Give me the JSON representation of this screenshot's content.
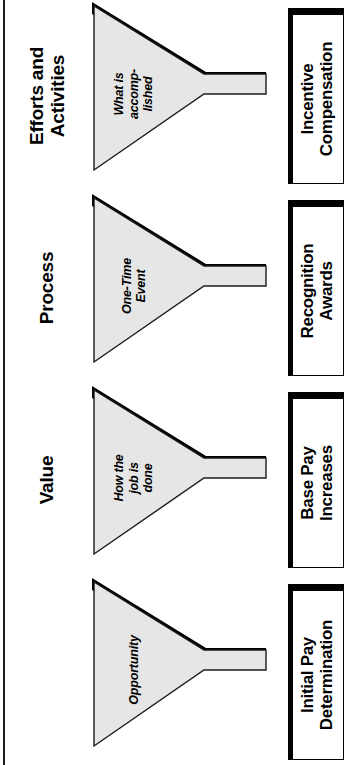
{
  "diagram": {
    "orientation": "rotated-90",
    "colors": {
      "funnel_fill": "#e6e6e6",
      "funnel_outline": "#1a1a1a",
      "shadow": "#000000",
      "box_fill": "#ffffff",
      "background": "#ffffff"
    },
    "rows": [
      {
        "category": "Results",
        "funnel_caption": "What is\naccomp-\nlished",
        "outcome": "Incentive\nCompensation"
      },
      {
        "category": "Efforts and\nActivities",
        "funnel_caption": "One-Time\nEvent",
        "outcome": "Recognition\nAwards"
      },
      {
        "category": "Process",
        "funnel_caption": "How the\njob is\ndone",
        "outcome": "Base Pay\nIncreases"
      },
      {
        "category": "Value",
        "funnel_caption": "Opportunity",
        "outcome": "Initial Pay\nDetermination"
      }
    ]
  }
}
